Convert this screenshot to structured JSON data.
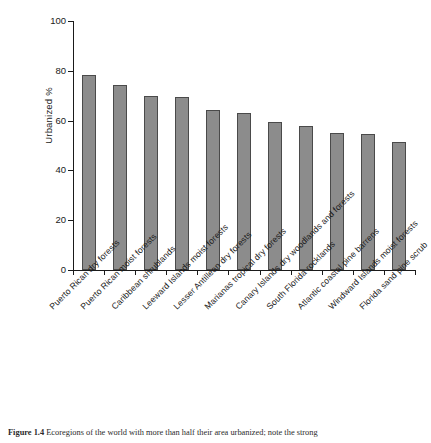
{
  "figure": {
    "caption_label": "Figure 1.4",
    "caption_text": "Ecoregions of the world with more than half their area urbanized; note the strong"
  },
  "chart_data": {
    "type": "bar",
    "title": "",
    "xlabel": "",
    "ylabel": "Urbanized %",
    "ylim": [
      0,
      100
    ],
    "yticks": [
      0,
      20,
      40,
      60,
      80,
      100
    ],
    "ytick_labels": [
      "0",
      "20",
      "40",
      "60",
      "80",
      "100"
    ],
    "grid": false,
    "legend": false,
    "bar_color": "#8c8c8c",
    "bar_edge_color": "#4a4a4a",
    "categories": [
      "Puerto Rican dry forests",
      "Puerto Rican moist forests",
      "Caribbean shrublands",
      "Leeward Islands moist forests",
      "Lesser Antillean dry forests",
      "Marianas tropical dry forests",
      "Canary Islands dry woodlands and forests",
      "South Florida rocklands",
      "Atlantic coastal pine barrens",
      "Windward Islands moist forests",
      "Florida sand pine scrub"
    ],
    "values": [
      78.2,
      74.4,
      69.9,
      69.5,
      64.2,
      63.1,
      59.4,
      57.7,
      55.1,
      54.7,
      51.4
    ]
  }
}
